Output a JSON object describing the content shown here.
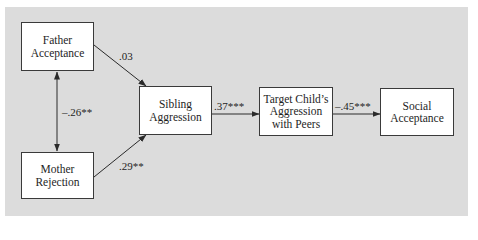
{
  "diagram": {
    "type": "path-model",
    "nodes": [
      {
        "id": "father",
        "lines": [
          "Father",
          "Acceptance"
        ]
      },
      {
        "id": "mother",
        "lines": [
          "Mother",
          "Rejection"
        ]
      },
      {
        "id": "sibling",
        "lines": [
          "Sibling",
          "Aggression"
        ]
      },
      {
        "id": "target",
        "lines": [
          "Target Child’s",
          "Aggression",
          "with Peers"
        ]
      },
      {
        "id": "social",
        "lines": [
          "Social",
          "Acceptance"
        ]
      }
    ],
    "edges": [
      {
        "from": "father",
        "to": "sibling",
        "label": ".03"
      },
      {
        "from": "mother",
        "to": "sibling",
        "label": ".29**"
      },
      {
        "from": "father",
        "to": "mother",
        "label": "–.26**",
        "bidirectional": true
      },
      {
        "from": "sibling",
        "to": "target",
        "label": ".37***"
      },
      {
        "from": "target",
        "to": "social",
        "label": "–.45***"
      }
    ]
  },
  "colors": {
    "background": "#ffffff",
    "panel": "#dcdcdc",
    "box_fill": "#ffffff",
    "stroke": "#3a3a3a",
    "text": "#1e1e1e"
  }
}
